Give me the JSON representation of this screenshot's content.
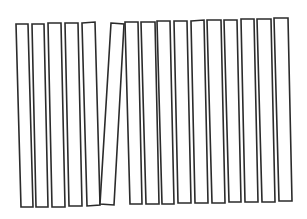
{
  "figure": {
    "stroke_color": "#2b2b2b",
    "background_color": "#ffffff",
    "bar_count": 16,
    "tilted_bar_index": 6,
    "bars": [
      {
        "index": 1,
        "points": "16,24 28,24 33,207 21,207"
      },
      {
        "index": 2,
        "points": "32,24 44,24 48,207 36,207"
      },
      {
        "index": 3,
        "points": "48,23 61,23 65,207 52,207"
      },
      {
        "index": 4,
        "points": "65,23 78,23 82,206 69,206"
      },
      {
        "index": 5,
        "points": "82,23 95,22 100,205 87,206"
      },
      {
        "index": 6,
        "points": "111,23 124,24 114,205 100,204"
      },
      {
        "index": 7,
        "points": "125,22 138,22 142,204 130,204"
      },
      {
        "index": 8,
        "points": "141,22 155,22 159,204 146,204"
      },
      {
        "index": 9,
        "points": "157,21 170,21 174,204 162,204"
      },
      {
        "index": 10,
        "points": "174,21 187,21 191,203 178,203"
      },
      {
        "index": 11,
        "points": "191,21 204,20 208,203 195,203"
      },
      {
        "index": 12,
        "points": "207,20 221,20 225,203 212,203"
      },
      {
        "index": 13,
        "points": "224,20 237,20 241,202 229,202"
      },
      {
        "index": 14,
        "points": "241,19 254,19 258,202 245,202"
      },
      {
        "index": 15,
        "points": "257,19 271,19 275,202 262,202"
      },
      {
        "index": 16,
        "points": "274,18 288,18 292,201 279,201"
      }
    ]
  }
}
